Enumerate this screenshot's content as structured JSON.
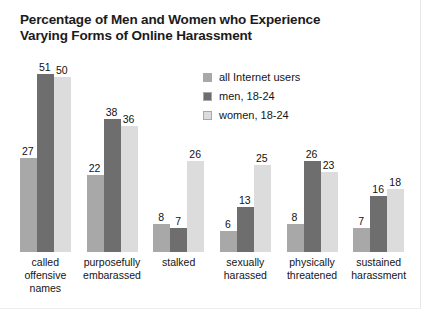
{
  "chart_data": {
    "type": "bar",
    "title": "Percentage of Men and Women who Experience Varying Forms of Online Harassment",
    "title_line1": "Percentage of Men and Women who Experience",
    "title_line2": "Varying Forms of Online Harassment",
    "xlabel": "",
    "ylabel": "",
    "ylim": [
      0,
      55
    ],
    "grid": false,
    "legend_position": "upper-center-right",
    "categories": [
      "called offensive names",
      "purposefully embarassed",
      "stalked",
      "sexually harassed",
      "physically threatened",
      "sustained harassment"
    ],
    "category_lines": [
      [
        "called",
        "offensive",
        "names"
      ],
      [
        "purposefully",
        "embarassed"
      ],
      [
        "stalked"
      ],
      [
        "sexually",
        "harassed"
      ],
      [
        "physically",
        "threatened"
      ],
      [
        "sustained",
        "harassment"
      ]
    ],
    "series": [
      {
        "name": "all Internet users",
        "color": "#a8a8a8",
        "values": [
          27,
          22,
          8,
          6,
          8,
          7
        ]
      },
      {
        "name": "men, 18-24",
        "color": "#6e6e6e",
        "values": [
          51,
          38,
          7,
          13,
          26,
          16
        ]
      },
      {
        "name": "women, 18-24",
        "color": "#dcdcdc",
        "values": [
          50,
          36,
          26,
          25,
          23,
          18
        ]
      }
    ]
  },
  "legend": {
    "items": [
      {
        "label": "all Internet users",
        "color": "#a8a8a8"
      },
      {
        "label": "men, 18-24",
        "color": "#6e6e6e"
      },
      {
        "label": "women, 18-24",
        "color": "#dcdcdc"
      }
    ]
  }
}
